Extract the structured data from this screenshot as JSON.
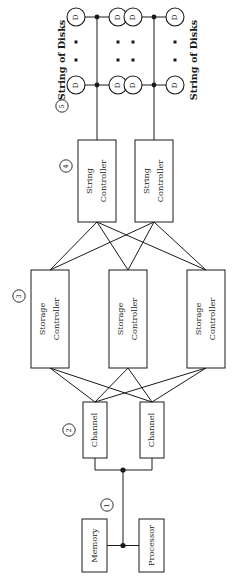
{
  "diagram": {
    "orientation": "rotated-90-ccw",
    "colors": {
      "ink": "#1a1a1a",
      "paper": "#ffffff"
    },
    "levels": [
      {
        "marker": "1",
        "name": "bus"
      },
      {
        "marker": "2",
        "name": "channel"
      },
      {
        "marker": "3",
        "name": "storage-controller"
      },
      {
        "marker": "4",
        "name": "string-controller"
      },
      {
        "marker": "5",
        "name": "string-of-disks"
      }
    ],
    "markers": {
      "bus": "①",
      "channel": "②",
      "storage_controller": "③",
      "string_controller": "④",
      "string_of_disks": "⑤"
    },
    "group_labels": {
      "string_of_disks_top": "String of Disks",
      "string_of_disks_bottom": "String of Disks"
    },
    "boxes": {
      "memory": "Memory",
      "processor": "Processor",
      "channel_1": "Channel",
      "channel_2": "Channel",
      "storage_controller_1_line1": "Storage",
      "storage_controller_1_line2": "Controller",
      "storage_controller_2_line1": "Storage",
      "storage_controller_2_line2": "Controller",
      "storage_controller_3_line1": "Storage",
      "storage_controller_3_line2": "Controller",
      "string_controller_1_line1": "String",
      "string_controller_1_line2": "Controller",
      "string_controller_2_line1": "String",
      "string_controller_2_line2": "Controller"
    },
    "disks": {
      "label": "D",
      "string_a_top_left": "D",
      "string_a_top_right": "D",
      "string_a_bottom_left": "D",
      "string_a_bottom_right": "D",
      "string_b_top_left": "D",
      "string_b_top_right": "D",
      "string_b_bottom_left": "D",
      "string_b_bottom_right": "D"
    }
  }
}
